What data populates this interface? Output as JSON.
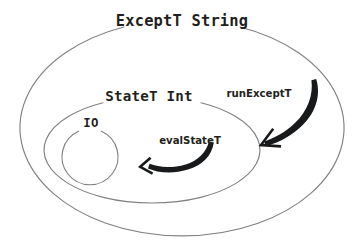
{
  "diagram": {
    "background_color": "#ffffff",
    "ring_stroke_color": "#818181",
    "arrow_color": "#17191a",
    "text_color": "#231f20",
    "rings": [
      {
        "id": "outer",
        "label": "ExceptT String",
        "shape": "ellipse",
        "cx": 182,
        "cy": 124,
        "rx": 162,
        "ry": 108,
        "label_x": 182,
        "label_y": 26,
        "gap_start_deg": 249,
        "gap_end_deg": 291
      },
      {
        "id": "middle",
        "label": "StateT Int",
        "shape": "ellipse",
        "cx": 152,
        "cy": 150,
        "rx": 108,
        "ry": 53,
        "label_x": 149,
        "label_y": 101,
        "gap_start_deg": 243,
        "gap_end_deg": 297
      },
      {
        "id": "inner",
        "label": "IO",
        "shape": "circle",
        "cx": 90,
        "cy": 157,
        "rx": 28,
        "ry": 28,
        "label_x": 91,
        "label_y": 127,
        "gap_start_deg": 246,
        "gap_end_deg": 294
      }
    ],
    "arrows": [
      {
        "id": "run-exceptt",
        "label": "runExceptT",
        "label_x": 259,
        "label_y": 97,
        "from": "ExceptT String",
        "to": "StateT Int",
        "direction": "down-left"
      },
      {
        "id": "eval-statet",
        "label": "evalStateT",
        "label_x": 190,
        "label_y": 144,
        "from": "StateT Int",
        "to": "IO",
        "direction": "left"
      }
    ]
  }
}
